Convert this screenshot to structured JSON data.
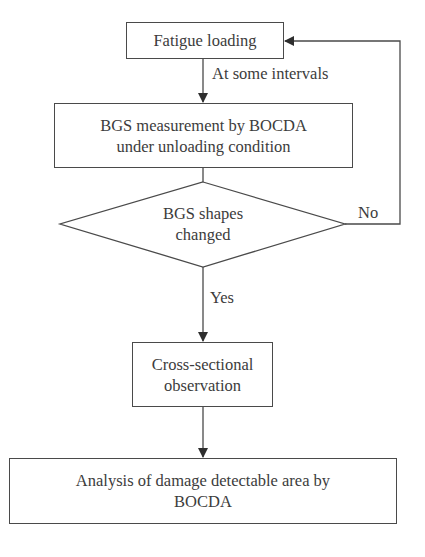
{
  "diagram": {
    "type": "flowchart",
    "nodes": {
      "fatigue_loading": {
        "shape": "rectangle",
        "line1": "Fatigue loading"
      },
      "bgs_measurement": {
        "shape": "rectangle",
        "line1": "BGS measurement by BOCDA",
        "line2": "under unloading condition"
      },
      "decision": {
        "shape": "diamond",
        "line1": "BGS shapes",
        "line2": "changed"
      },
      "cross_section": {
        "shape": "rectangle",
        "line1": "Cross-sectional",
        "line2": "observation"
      },
      "analysis": {
        "shape": "rectangle",
        "line1": "Analysis of damage detectable area by",
        "line2": "BOCDA"
      }
    },
    "edge_labels": {
      "interval": "At some intervals",
      "no": "No",
      "yes": "Yes"
    },
    "edges": [
      {
        "from": "fatigue_loading",
        "to": "bgs_measurement",
        "label": "At some intervals"
      },
      {
        "from": "bgs_measurement",
        "to": "decision",
        "label": ""
      },
      {
        "from": "decision",
        "to": "fatigue_loading",
        "label": "No"
      },
      {
        "from": "decision",
        "to": "cross_section",
        "label": "Yes"
      },
      {
        "from": "cross_section",
        "to": "analysis",
        "label": ""
      }
    ],
    "colors": {
      "stroke": "#4a4a4a",
      "text": "#3c3c3c",
      "background": "#ffffff"
    }
  }
}
